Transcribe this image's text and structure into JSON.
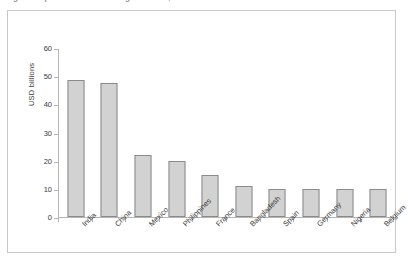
{
  "caption": {
    "sliver_text": "Figure: Top remittance-receiving countries, 2023"
  },
  "chart_data": {
    "type": "bar",
    "title": "",
    "xlabel": "",
    "ylabel": "USD billions",
    "categories": [
      "India",
      "China",
      "Mexico",
      "Philippines",
      "France",
      "Bangladesh",
      "Spain",
      "Germany",
      "Nigeria",
      "Belgium"
    ],
    "values": [
      49,
      48,
      22,
      20,
      15,
      11,
      10,
      10,
      10,
      10
    ],
    "ylim": [
      0,
      60
    ],
    "y_ticks": [
      0,
      10,
      20,
      30,
      40,
      50,
      60
    ],
    "y_tick_labels": [
      "0",
      "10",
      "20",
      "30",
      "40",
      "50",
      "60"
    ],
    "grid": false,
    "legend": "none",
    "bar_fill_color": "#d2d2d2",
    "bar_border_color": "#8a8a8a",
    "axis_color": "#b5b5b5",
    "frame_color": "#c8c8c8"
  }
}
